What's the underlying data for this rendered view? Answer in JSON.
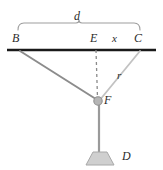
{
  "figure": {
    "background_color": "#ffffff",
    "width": 163,
    "height": 170,
    "labels": {
      "d": "d",
      "B": "B",
      "E": "E",
      "x": "x",
      "C": "C",
      "r": "r",
      "F": "F",
      "D": "D"
    },
    "colors": {
      "beam": "#1a1a1a",
      "cable_left": "#8c8c8c",
      "cable_right": "#c2c2c2",
      "rope": "#9a9a9a",
      "dashed": "#8a8a8a",
      "brace": "#9e9e9e",
      "weight_fill": "#cfcfcf",
      "weight_stroke": "#a8a8a8",
      "pulley_fill": "#b5b5b5",
      "pulley_stroke": "#8f8f8f",
      "label_text": "#2b2b2b"
    },
    "geometry": {
      "beam": {
        "x1": 7,
        "y1": 50,
        "x2": 156,
        "y2": 50,
        "stroke_width": 2.6
      },
      "brace": {
        "left_x": 18,
        "right_x": 140,
        "top_y": 22,
        "bottom_y": 30,
        "tick_x": 79
      },
      "point_B": {
        "x": 20,
        "y": 50
      },
      "point_E": {
        "x": 96,
        "y": 50
      },
      "point_C": {
        "x": 140,
        "y": 50
      },
      "point_F": {
        "x": 99,
        "y": 101
      },
      "point_D": {
        "x": 99,
        "y": 156
      },
      "cable_BF": {
        "x1": 20,
        "y1": 51,
        "x2": 99,
        "y2": 101,
        "stroke_width": 2.0
      },
      "cable_CF": {
        "x1": 140,
        "y1": 51,
        "x2": 99,
        "y2": 101,
        "stroke_width": 1.8
      },
      "dashed_EF": {
        "x1": 96,
        "y1": 50,
        "x2": 97,
        "y2": 99,
        "stroke_width": 1.4,
        "dash": "3 3"
      },
      "rope_FD": {
        "x1": 99,
        "y1": 103,
        "x2": 99,
        "y2": 152,
        "stroke_width": 2.2
      },
      "pulley": {
        "cx": 98,
        "cy": 101,
        "r": 4.2
      },
      "weight": {
        "top_left_x": 93,
        "top_right_x": 107,
        "bottom_left_x": 86,
        "bottom_right_x": 114,
        "top_y": 152,
        "bottom_y": 165
      }
    }
  }
}
